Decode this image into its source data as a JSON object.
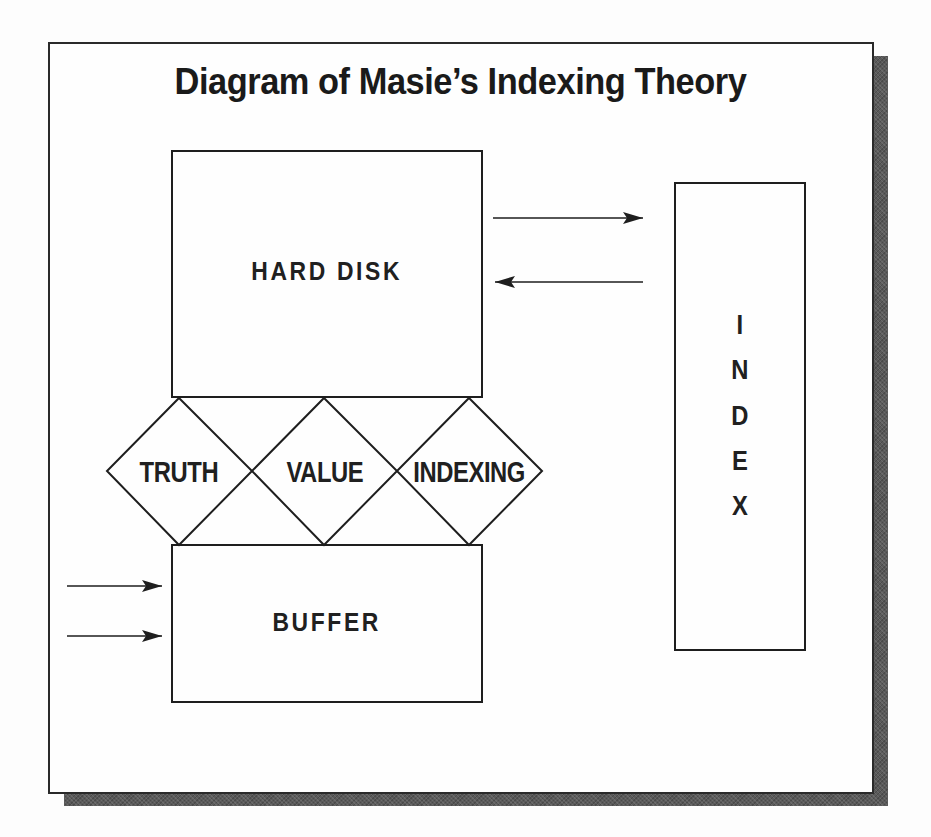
{
  "title": "Diagram of Masie’s Indexing Theory",
  "boxes": {
    "hard_disk": {
      "label": "HARD DISK"
    },
    "buffer": {
      "label": "BUFFER"
    },
    "index": {
      "label": "INDEX",
      "letters": [
        "I",
        "N",
        "D",
        "E",
        "X"
      ]
    }
  },
  "diamonds": [
    {
      "label": "TRUTH"
    },
    {
      "label": "VALUE"
    },
    {
      "label": "INDEXING"
    }
  ],
  "arrows": [
    {
      "from": "hard_disk",
      "to": "index",
      "direction": "right"
    },
    {
      "from": "index",
      "to": "hard_disk",
      "direction": "left"
    },
    {
      "from": "external",
      "to": "buffer",
      "direction": "right"
    },
    {
      "from": "external",
      "to": "buffer",
      "direction": "right"
    }
  ],
  "colors": {
    "line": "#1e1e1e",
    "shadow": "#5a5a5a",
    "background": "#fefefe"
  }
}
